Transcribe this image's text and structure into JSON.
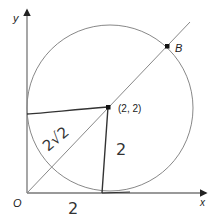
{
  "figure": {
    "type": "coordinate-geometry-diagram",
    "axes": {
      "x_label": "x",
      "y_label": "y",
      "origin_label": "O"
    },
    "circle": {
      "center_label": "(2, 2)",
      "center": [
        2,
        2
      ],
      "radius": 2,
      "tangent_to": [
        "x-axis",
        "y-axis"
      ]
    },
    "line": {
      "equation": "y = x",
      "through": [
        "O",
        "(2, 2)",
        "B"
      ]
    },
    "points": [
      {
        "name": "B",
        "label": "B"
      },
      {
        "name": "center",
        "label": "(2, 2)"
      }
    ],
    "handwritten_annotations": {
      "diagonal_length": "2√2",
      "vertical_radius": "2",
      "horizontal_base": "2"
    }
  },
  "colors": {
    "axis": "#777777",
    "circle": "#888888",
    "line": "#888888",
    "handwritten": "#333333",
    "point": "#111111"
  }
}
